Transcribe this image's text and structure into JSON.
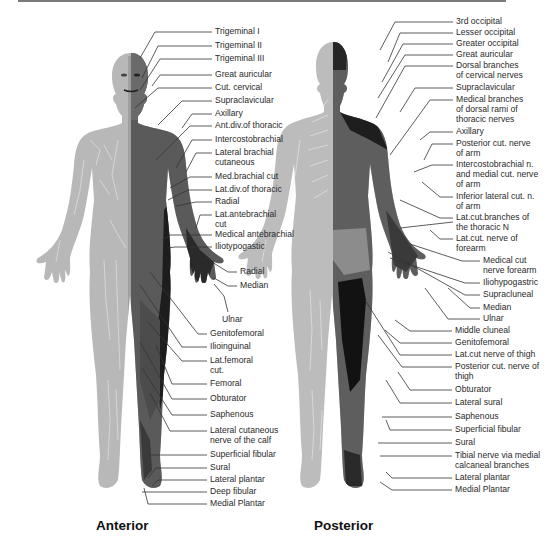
{
  "figure": {
    "colors": {
      "skin_light": "#b9b9b9",
      "skin_mid": "#8a8a8a",
      "dermatome_dark": "#4a4a4a",
      "dermatome_black": "#1c1c1c",
      "leader_line": "#333333",
      "top_rule": "#7a7a7a"
    },
    "anterior": {
      "caption": "Anterior",
      "labels": [
        {
          "text": "Trigeminal I",
          "x": 215,
          "y": 28
        },
        {
          "text": "Trigeminal II",
          "x": 215,
          "y": 42
        },
        {
          "text": "Trigeminal III",
          "x": 215,
          "y": 55
        },
        {
          "text": "Great auricular",
          "x": 215,
          "y": 71
        },
        {
          "text": "Cut. cervical",
          "x": 215,
          "y": 84
        },
        {
          "text": "Supraclavicular",
          "x": 215,
          "y": 97
        },
        {
          "text": "Axillary",
          "x": 215,
          "y": 110
        },
        {
          "text": "Ant.div.of thoracic",
          "x": 215,
          "y": 122
        },
        {
          "text": "Intercostobrachial",
          "x": 215,
          "y": 136
        },
        {
          "text": "Lateral brachial",
          "x": 215,
          "y": 149
        },
        {
          "text": "cutaneous",
          "x": 215,
          "y": 159
        },
        {
          "text": "Med.brachial cut",
          "x": 215,
          "y": 173
        },
        {
          "text": "Lat.div.of thoracic",
          "x": 215,
          "y": 186
        },
        {
          "text": "Radial",
          "x": 215,
          "y": 198
        },
        {
          "text": "Lat.antebrachial",
          "x": 215,
          "y": 211
        },
        {
          "text": "cut",
          "x": 215,
          "y": 221
        },
        {
          "text": "Medical antebrachial",
          "x": 215,
          "y": 231
        },
        {
          "text": "Iliotypogastic",
          "x": 215,
          "y": 243
        },
        {
          "text": "Radial",
          "x": 240,
          "y": 268
        },
        {
          "text": "Median",
          "x": 240,
          "y": 282
        },
        {
          "text": "Ulnar",
          "x": 222,
          "y": 316
        },
        {
          "text": "Genitofemoral",
          "x": 210,
          "y": 330
        },
        {
          "text": "Ilioinguinal",
          "x": 210,
          "y": 343
        },
        {
          "text": "Lat.femoral",
          "x": 210,
          "y": 357
        },
        {
          "text": "cut.",
          "x": 210,
          "y": 367
        },
        {
          "text": "Femoral",
          "x": 210,
          "y": 380
        },
        {
          "text": "Obturator",
          "x": 210,
          "y": 395
        },
        {
          "text": "Saphenous",
          "x": 210,
          "y": 411
        },
        {
          "text": "Lateral cutaneous",
          "x": 210,
          "y": 427
        },
        {
          "text": "nerve of the calf",
          "x": 210,
          "y": 437
        },
        {
          "text": "Superficial fibular",
          "x": 210,
          "y": 451
        },
        {
          "text": "Sural",
          "x": 210,
          "y": 464
        },
        {
          "text": "Lateral plantar",
          "x": 210,
          "y": 476
        },
        {
          "text": "Deep fibular",
          "x": 210,
          "y": 488
        },
        {
          "text": "Medial Plantar",
          "x": 210,
          "y": 500
        }
      ]
    },
    "posterior": {
      "caption": "Posterior",
      "labels": [
        {
          "text": "3rd occipital",
          "x": 456,
          "y": 18
        },
        {
          "text": "Lesser occipital",
          "x": 456,
          "y": 29
        },
        {
          "text": "Greater occipital",
          "x": 456,
          "y": 40
        },
        {
          "text": "Great auricular",
          "x": 456,
          "y": 51
        },
        {
          "text": "Dorsal branches",
          "x": 456,
          "y": 62
        },
        {
          "text": "of cervical nerves",
          "x": 456,
          "y": 72
        },
        {
          "text": "Supraclavicular",
          "x": 456,
          "y": 84
        },
        {
          "text": "Medical branches",
          "x": 456,
          "y": 96
        },
        {
          "text": "of dorsal rami of",
          "x": 456,
          "y": 106
        },
        {
          "text": "thoracic nerves",
          "x": 456,
          "y": 116
        },
        {
          "text": "Axillary",
          "x": 456,
          "y": 128
        },
        {
          "text": "Posterior cut. nerve",
          "x": 456,
          "y": 140
        },
        {
          "text": "of arm",
          "x": 456,
          "y": 150
        },
        {
          "text": "Intercostobrachial n.",
          "x": 456,
          "y": 161
        },
        {
          "text": "and medial cut. nerve",
          "x": 456,
          "y": 171
        },
        {
          "text": "of arm",
          "x": 456,
          "y": 181
        },
        {
          "text": "Inferior lateral cut. n.",
          "x": 456,
          "y": 193
        },
        {
          "text": "of arm",
          "x": 456,
          "y": 203
        },
        {
          "text": "Lat.cut.branches of",
          "x": 456,
          "y": 214
        },
        {
          "text": "the thoracic N",
          "x": 456,
          "y": 224
        },
        {
          "text": "Lat.cut. nerve of",
          "x": 456,
          "y": 235
        },
        {
          "text": "forearm",
          "x": 456,
          "y": 245
        },
        {
          "text": "Medical cut",
          "x": 483,
          "y": 257
        },
        {
          "text": "nerve forearm",
          "x": 483,
          "y": 267
        },
        {
          "text": "Iliohypogastric",
          "x": 483,
          "y": 279
        },
        {
          "text": "Supracluneal",
          "x": 483,
          "y": 291
        },
        {
          "text": "Median",
          "x": 483,
          "y": 304
        },
        {
          "text": "Ulnar",
          "x": 483,
          "y": 315
        },
        {
          "text": "Middle cluneal",
          "x": 455,
          "y": 327
        },
        {
          "text": "Genitofemoral",
          "x": 455,
          "y": 339
        },
        {
          "text": "Lat.cut nerve of thigh",
          "x": 455,
          "y": 351
        },
        {
          "text": "Posterior cut. nerve of",
          "x": 455,
          "y": 363
        },
        {
          "text": "thigh",
          "x": 455,
          "y": 373
        },
        {
          "text": "Obturator",
          "x": 455,
          "y": 386
        },
        {
          "text": "Lateral sural",
          "x": 455,
          "y": 399
        },
        {
          "text": "Saphenous",
          "x": 455,
          "y": 413
        },
        {
          "text": "Superficial fibular",
          "x": 455,
          "y": 426
        },
        {
          "text": "Sural",
          "x": 455,
          "y": 439
        },
        {
          "text": "Tibial nerve via medial",
          "x": 455,
          "y": 452
        },
        {
          "text": "calcaneal branches",
          "x": 455,
          "y": 462
        },
        {
          "text": "Lateral plantar",
          "x": 455,
          "y": 474
        },
        {
          "text": "Medial Plantar",
          "x": 455,
          "y": 486
        }
      ]
    }
  }
}
